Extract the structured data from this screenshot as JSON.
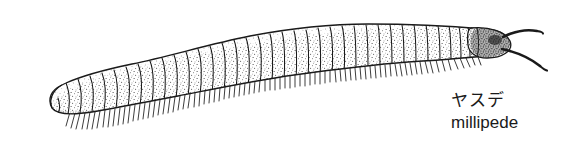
{
  "figure": {
    "background_color": "#ffffff",
    "ink_color": "#1a1a1a",
    "subject": "millipede",
    "style": "pen-and-ink stipple line drawing"
  },
  "caption": {
    "japanese": "ヤスデ",
    "english": "millipede"
  },
  "illustration": {
    "body": {
      "orientation": "head-right",
      "segment_count": 42,
      "shading": "stipple",
      "outline_color": "#1a1a1a"
    },
    "head": {
      "position": "right-end",
      "antenna_count": 2,
      "shading": "dense-stipple"
    },
    "tail": {
      "position": "left-end",
      "shape": "rounded"
    },
    "legs": {
      "count": 78,
      "placement": "underside",
      "direction": "down-left"
    }
  }
}
